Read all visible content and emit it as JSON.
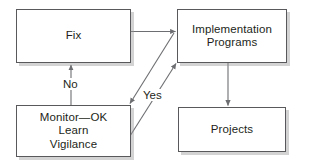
{
  "diagram": {
    "type": "flowchart",
    "background_color": "#ffffff",
    "border_color": "#59595b",
    "text_color": "#231f20",
    "shadow_color": "#969698",
    "nodes": [
      {
        "id": "fix",
        "label": "Fix",
        "x": 16,
        "y": 9,
        "width": 115,
        "height": 54
      },
      {
        "id": "impl",
        "label": "Implementation\nPrograms",
        "x": 177,
        "y": 9,
        "width": 110,
        "height": 54
      },
      {
        "id": "monitor",
        "label": "Monitor—OK\nLearn\nVigilance",
        "x": 16,
        "y": 105,
        "width": 115,
        "height": 52
      },
      {
        "id": "projects",
        "label": "Projects",
        "x": 178,
        "y": 107,
        "width": 108,
        "height": 45
      }
    ],
    "edges": [
      {
        "id": "fix-to-impl",
        "from": "fix",
        "to": "impl",
        "label": "",
        "style": "horizontal-arrow"
      },
      {
        "id": "monitor-to-fix",
        "from": "monitor",
        "to": "fix",
        "label": "No",
        "style": "vertical-arrow-up"
      },
      {
        "id": "impl-to-monitor",
        "from": "impl",
        "to": "monitor",
        "label": "",
        "style": "diagonal-arrow-down-left"
      },
      {
        "id": "monitor-to-impl",
        "from": "monitor",
        "to": "impl",
        "label": "Yes",
        "style": "diagonal-arrow-up-right"
      },
      {
        "id": "impl-to-projects",
        "from": "impl",
        "to": "projects",
        "label": "",
        "style": "vertical-arrow-down"
      }
    ],
    "edge_labels": {
      "no": "No",
      "yes": "Yes"
    }
  }
}
